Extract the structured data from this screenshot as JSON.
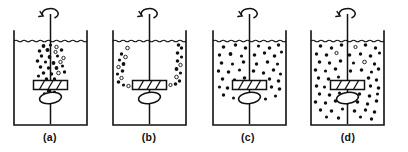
{
  "figure": {
    "type": "line-diagram",
    "background_color": "#ffffff",
    "line_color": "#111111",
    "panel_count": 4
  },
  "geometry": {
    "canvas": {
      "width": 408,
      "height": 152
    },
    "panel_origins_x": [
      14,
      113,
      213,
      311
    ],
    "vessel": {
      "width": 73,
      "top_y": 31,
      "bottom_y": 125,
      "surface_y": 41
    },
    "shaft": {
      "top_y": 14,
      "bottom_y": 124
    },
    "impeller": {
      "center_y": 85,
      "half_width": 17,
      "height": 9,
      "blade_count": 3
    },
    "disc": {
      "center_y": 98,
      "rx": 11,
      "ry": 5.5,
      "tilt_deg": -8
    },
    "rotation_arrow": {
      "center_y": 15,
      "radius": 8
    }
  },
  "panels": [
    {
      "id": "a",
      "caption": "(a)",
      "caption_x": 50,
      "caption_y": 141,
      "state": "incomplete-suspension-central-plume",
      "particles": [
        {
          "x": -7,
          "y": 46,
          "r": 1.9,
          "open": false
        },
        {
          "x": 0,
          "y": 45,
          "r": 1.6,
          "open": false
        },
        {
          "x": 6,
          "y": 47,
          "r": 1.7,
          "open": true
        },
        {
          "x": -11,
          "y": 51,
          "r": 1.8,
          "open": false
        },
        {
          "x": -3,
          "y": 50,
          "r": 2.0,
          "open": false
        },
        {
          "x": 5,
          "y": 52,
          "r": 1.6,
          "open": true
        },
        {
          "x": 11,
          "y": 50,
          "r": 1.8,
          "open": false
        },
        {
          "x": -9,
          "y": 56,
          "r": 1.7,
          "open": false
        },
        {
          "x": -1,
          "y": 57,
          "r": 1.9,
          "open": false
        },
        {
          "x": 7,
          "y": 56,
          "r": 1.6,
          "open": false
        },
        {
          "x": 13,
          "y": 58,
          "r": 1.7,
          "open": true
        },
        {
          "x": -13,
          "y": 61,
          "r": 1.8,
          "open": false
        },
        {
          "x": -5,
          "y": 62,
          "r": 1.6,
          "open": false
        },
        {
          "x": 3,
          "y": 63,
          "r": 1.9,
          "open": false
        },
        {
          "x": 10,
          "y": 62,
          "r": 1.7,
          "open": true
        },
        {
          "x": -10,
          "y": 67,
          "r": 1.8,
          "open": false
        },
        {
          "x": -2,
          "y": 68,
          "r": 1.7,
          "open": false
        },
        {
          "x": 6,
          "y": 68,
          "r": 1.9,
          "open": false
        },
        {
          "x": 12,
          "y": 66,
          "r": 1.6,
          "open": false
        },
        {
          "x": -7,
          "y": 73,
          "r": 1.8,
          "open": false
        },
        {
          "x": 1,
          "y": 74,
          "r": 1.7,
          "open": false
        },
        {
          "x": 8,
          "y": 73,
          "r": 1.8,
          "open": true
        },
        {
          "x": -12,
          "y": 76,
          "r": 1.6,
          "open": false
        },
        {
          "x": 14,
          "y": 72,
          "r": 1.7,
          "open": false
        },
        {
          "x": -4,
          "y": 79,
          "r": 1.8,
          "open": false
        },
        {
          "x": 4,
          "y": 79,
          "r": 1.7,
          "open": false
        },
        {
          "x": -2,
          "y": 91,
          "r": 1.8,
          "open": false
        },
        {
          "x": 4,
          "y": 92,
          "r": 1.6,
          "open": false
        },
        {
          "x": -6,
          "y": 94,
          "r": 1.7,
          "open": false
        },
        {
          "x": 1,
          "y": 95,
          "r": 1.5,
          "open": true
        },
        {
          "x": 7,
          "y": 96,
          "r": 1.6,
          "open": false
        }
      ]
    },
    {
      "id": "b",
      "caption": "(b)",
      "caption_x": 149,
      "caption_y": 141,
      "state": "wall-hugging-toroidal-loops",
      "particles": [
        {
          "x": -22,
          "y": 48,
          "r": 1.8,
          "open": true
        },
        {
          "x": -28,
          "y": 54,
          "r": 1.7,
          "open": false
        },
        {
          "x": -24,
          "y": 57,
          "r": 1.8,
          "open": true
        },
        {
          "x": -30,
          "y": 60,
          "r": 1.6,
          "open": false
        },
        {
          "x": -26,
          "y": 64,
          "r": 1.9,
          "open": false
        },
        {
          "x": -31,
          "y": 67,
          "r": 1.7,
          "open": true
        },
        {
          "x": -27,
          "y": 71,
          "r": 1.8,
          "open": false
        },
        {
          "x": -32,
          "y": 74,
          "r": 1.6,
          "open": false
        },
        {
          "x": -28,
          "y": 78,
          "r": 1.7,
          "open": true
        },
        {
          "x": -31,
          "y": 82,
          "r": 1.8,
          "open": false
        },
        {
          "x": -26,
          "y": 85,
          "r": 1.6,
          "open": false
        },
        {
          "x": -21,
          "y": 86,
          "r": 1.7,
          "open": true
        },
        {
          "x": -16,
          "y": 87,
          "r": 1.8,
          "open": false
        },
        {
          "x": -10,
          "y": 86,
          "r": 1.6,
          "open": false
        },
        {
          "x": 10,
          "y": 86,
          "r": 1.7,
          "open": false
        },
        {
          "x": 16,
          "y": 87,
          "r": 1.8,
          "open": false
        },
        {
          "x": 21,
          "y": 85,
          "r": 1.6,
          "open": true
        },
        {
          "x": 26,
          "y": 84,
          "r": 1.8,
          "open": false
        },
        {
          "x": 30,
          "y": 81,
          "r": 1.7,
          "open": false
        },
        {
          "x": 27,
          "y": 77,
          "r": 1.8,
          "open": true
        },
        {
          "x": 31,
          "y": 73,
          "r": 1.6,
          "open": false
        },
        {
          "x": 27,
          "y": 69,
          "r": 1.9,
          "open": false
        },
        {
          "x": 31,
          "y": 65,
          "r": 1.7,
          "open": true
        },
        {
          "x": 28,
          "y": 61,
          "r": 1.8,
          "open": false
        },
        {
          "x": 32,
          "y": 57,
          "r": 1.6,
          "open": false
        },
        {
          "x": 28,
          "y": 53,
          "r": 1.8,
          "open": false
        },
        {
          "x": 32,
          "y": 48,
          "r": 1.7,
          "open": false
        },
        {
          "x": 29,
          "y": 45,
          "r": 1.8,
          "open": false
        }
      ]
    },
    {
      "id": "c",
      "caption": "(c)",
      "caption_x": 248,
      "caption_y": 141,
      "state": "complete-suspension-upper-zone",
      "particles": [
        {
          "x": -26,
          "y": 47,
          "r": 1.8,
          "open": false
        },
        {
          "x": -14,
          "y": 45,
          "r": 1.7,
          "open": false
        },
        {
          "x": -4,
          "y": 48,
          "r": 1.8,
          "open": false
        },
        {
          "x": 9,
          "y": 46,
          "r": 1.6,
          "open": false
        },
        {
          "x": 20,
          "y": 48,
          "r": 1.8,
          "open": false
        },
        {
          "x": 29,
          "y": 45,
          "r": 1.7,
          "open": false
        },
        {
          "x": -30,
          "y": 55,
          "r": 1.7,
          "open": false
        },
        {
          "x": -19,
          "y": 54,
          "r": 1.9,
          "open": false
        },
        {
          "x": -8,
          "y": 56,
          "r": 1.6,
          "open": false
        },
        {
          "x": 5,
          "y": 55,
          "r": 1.8,
          "open": false
        },
        {
          "x": 15,
          "y": 53,
          "r": 1.7,
          "open": false
        },
        {
          "x": 25,
          "y": 56,
          "r": 1.8,
          "open": false
        },
        {
          "x": 32,
          "y": 52,
          "r": 1.6,
          "open": false
        },
        {
          "x": -28,
          "y": 63,
          "r": 1.8,
          "open": false
        },
        {
          "x": -17,
          "y": 64,
          "r": 1.6,
          "open": false
        },
        {
          "x": -6,
          "y": 62,
          "r": 1.8,
          "open": false
        },
        {
          "x": 7,
          "y": 64,
          "r": 1.7,
          "open": false
        },
        {
          "x": 18,
          "y": 62,
          "r": 1.8,
          "open": false
        },
        {
          "x": 28,
          "y": 64,
          "r": 1.6,
          "open": false
        },
        {
          "x": -31,
          "y": 71,
          "r": 1.7,
          "open": false
        },
        {
          "x": -21,
          "y": 72,
          "r": 1.8,
          "open": false
        },
        {
          "x": -10,
          "y": 70,
          "r": 1.6,
          "open": false
        },
        {
          "x": 4,
          "y": 71,
          "r": 1.8,
          "open": false
        },
        {
          "x": 14,
          "y": 73,
          "r": 1.7,
          "open": false
        },
        {
          "x": 24,
          "y": 70,
          "r": 1.8,
          "open": false
        },
        {
          "x": 31,
          "y": 74,
          "r": 1.6,
          "open": false
        },
        {
          "x": -27,
          "y": 79,
          "r": 1.8,
          "open": false
        },
        {
          "x": -15,
          "y": 80,
          "r": 1.7,
          "open": false
        },
        {
          "x": -5,
          "y": 78,
          "r": 1.8,
          "open": false
        },
        {
          "x": 20,
          "y": 79,
          "r": 1.7,
          "open": false
        },
        {
          "x": 29,
          "y": 81,
          "r": 1.8,
          "open": false
        },
        {
          "x": -30,
          "y": 87,
          "r": 1.6,
          "open": false
        },
        {
          "x": -22,
          "y": 88,
          "r": 1.8,
          "open": false
        },
        {
          "x": 22,
          "y": 87,
          "r": 1.7,
          "open": false
        },
        {
          "x": 30,
          "y": 89,
          "r": 1.8,
          "open": false
        },
        {
          "x": -26,
          "y": 95,
          "r": 1.7,
          "open": false
        },
        {
          "x": 26,
          "y": 96,
          "r": 1.6,
          "open": false
        },
        {
          "x": -16,
          "y": 98,
          "r": 1.5,
          "open": false
        },
        {
          "x": 16,
          "y": 99,
          "r": 1.6,
          "open": false
        }
      ]
    },
    {
      "id": "d",
      "caption": "(d)",
      "caption_x": 348,
      "caption_y": 141,
      "state": "uniform-homogeneous-suspension",
      "particles": [
        {
          "x": -27,
          "y": 46,
          "r": 1.8,
          "open": false
        },
        {
          "x": -16,
          "y": 48,
          "r": 1.7,
          "open": false
        },
        {
          "x": -6,
          "y": 45,
          "r": 1.8,
          "open": false
        },
        {
          "x": 8,
          "y": 47,
          "r": 1.6,
          "open": true
        },
        {
          "x": 18,
          "y": 45,
          "r": 1.8,
          "open": false
        },
        {
          "x": 28,
          "y": 48,
          "r": 1.7,
          "open": false
        },
        {
          "x": -31,
          "y": 54,
          "r": 1.7,
          "open": false
        },
        {
          "x": -21,
          "y": 55,
          "r": 1.8,
          "open": false
        },
        {
          "x": -11,
          "y": 53,
          "r": 1.6,
          "open": true
        },
        {
          "x": 2,
          "y": 55,
          "r": 1.8,
          "open": false
        },
        {
          "x": 13,
          "y": 54,
          "r": 1.7,
          "open": false
        },
        {
          "x": 23,
          "y": 56,
          "r": 1.8,
          "open": false
        },
        {
          "x": 32,
          "y": 53,
          "r": 1.6,
          "open": false
        },
        {
          "x": -28,
          "y": 62,
          "r": 1.8,
          "open": false
        },
        {
          "x": -18,
          "y": 63,
          "r": 1.7,
          "open": false
        },
        {
          "x": -7,
          "y": 61,
          "r": 1.8,
          "open": false
        },
        {
          "x": 6,
          "y": 63,
          "r": 1.6,
          "open": false
        },
        {
          "x": 17,
          "y": 62,
          "r": 1.8,
          "open": true
        },
        {
          "x": 27,
          "y": 64,
          "r": 1.7,
          "open": false
        },
        {
          "x": -32,
          "y": 70,
          "r": 1.8,
          "open": false
        },
        {
          "x": -22,
          "y": 71,
          "r": 1.6,
          "open": false
        },
        {
          "x": -12,
          "y": 69,
          "r": 1.8,
          "open": false
        },
        {
          "x": 3,
          "y": 71,
          "r": 1.7,
          "open": false
        },
        {
          "x": 14,
          "y": 70,
          "r": 1.8,
          "open": false
        },
        {
          "x": 24,
          "y": 72,
          "r": 1.6,
          "open": false
        },
        {
          "x": 31,
          "y": 69,
          "r": 1.8,
          "open": false
        },
        {
          "x": -29,
          "y": 78,
          "r": 1.7,
          "open": false
        },
        {
          "x": -19,
          "y": 79,
          "r": 1.8,
          "open": false
        },
        {
          "x": -9,
          "y": 77,
          "r": 1.6,
          "open": false
        },
        {
          "x": 21,
          "y": 78,
          "r": 1.8,
          "open": false
        },
        {
          "x": 29,
          "y": 80,
          "r": 1.7,
          "open": false
        },
        {
          "x": -31,
          "y": 86,
          "r": 1.8,
          "open": false
        },
        {
          "x": -23,
          "y": 87,
          "r": 1.6,
          "open": false
        },
        {
          "x": -13,
          "y": 85,
          "r": 1.8,
          "open": false
        },
        {
          "x": 23,
          "y": 86,
          "r": 1.7,
          "open": false
        },
        {
          "x": 31,
          "y": 88,
          "r": 1.8,
          "open": false
        },
        {
          "x": -28,
          "y": 94,
          "r": 1.7,
          "open": false
        },
        {
          "x": -18,
          "y": 95,
          "r": 1.8,
          "open": false
        },
        {
          "x": -8,
          "y": 93,
          "r": 1.6,
          "open": false
        },
        {
          "x": 2,
          "y": 95,
          "r": 1.8,
          "open": false
        },
        {
          "x": 12,
          "y": 94,
          "r": 1.7,
          "open": false
        },
        {
          "x": 22,
          "y": 96,
          "r": 1.8,
          "open": false
        },
        {
          "x": 30,
          "y": 94,
          "r": 1.6,
          "open": false
        },
        {
          "x": -32,
          "y": 102,
          "r": 1.8,
          "open": false
        },
        {
          "x": -22,
          "y": 103,
          "r": 1.7,
          "open": false
        },
        {
          "x": -12,
          "y": 101,
          "r": 1.8,
          "open": false
        },
        {
          "x": 0,
          "y": 103,
          "r": 1.6,
          "open": false
        },
        {
          "x": 10,
          "y": 102,
          "r": 1.8,
          "open": false
        },
        {
          "x": 20,
          "y": 104,
          "r": 1.7,
          "open": false
        },
        {
          "x": 29,
          "y": 101,
          "r": 1.8,
          "open": false
        },
        {
          "x": -27,
          "y": 110,
          "r": 1.7,
          "open": false
        },
        {
          "x": -16,
          "y": 111,
          "r": 1.8,
          "open": false
        },
        {
          "x": -5,
          "y": 109,
          "r": 1.6,
          "open": false
        },
        {
          "x": 7,
          "y": 111,
          "r": 1.8,
          "open": false
        },
        {
          "x": 18,
          "y": 110,
          "r": 1.7,
          "open": false
        },
        {
          "x": 27,
          "y": 112,
          "r": 1.8,
          "open": false
        },
        {
          "x": -21,
          "y": 117,
          "r": 1.6,
          "open": false
        },
        {
          "x": -9,
          "y": 118,
          "r": 1.7,
          "open": false
        },
        {
          "x": 13,
          "y": 117,
          "r": 1.6,
          "open": false
        },
        {
          "x": 24,
          "y": 119,
          "r": 1.7,
          "open": false
        }
      ]
    }
  ]
}
